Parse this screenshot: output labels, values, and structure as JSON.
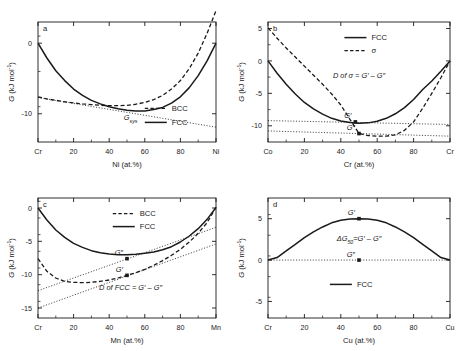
{
  "figure": {
    "background": "#ffffff",
    "ink": "#1a1a1a",
    "panels": [
      "a",
      "b",
      "c",
      "d"
    ]
  },
  "axis_title_y": "G (kJ mol",
  "axis_title_y_sup": "-1",
  "axis_title_y_close": ")",
  "chart_data": [
    {
      "id": "a",
      "type": "line",
      "panel_label": "a",
      "title": "",
      "xlabel": "Ni (at.%)",
      "ylabel": "G (kJ mol-1)",
      "xlim": [
        0,
        100
      ],
      "ylim": [
        -14,
        3
      ],
      "xticks": [
        0,
        20,
        40,
        60,
        80,
        100
      ],
      "xticklabels": [
        "Cr",
        "20",
        "40",
        "60",
        "80",
        "Ni"
      ],
      "yticks": [
        0,
        -10
      ],
      "yticklabels": [
        "0",
        "-10"
      ],
      "grid": false,
      "legend_position": "bottom-right",
      "legend": [
        {
          "name": "BCC",
          "style": "dashed"
        },
        {
          "name": "FCC",
          "style": "solid"
        }
      ],
      "annotations": [
        {
          "text": "G",
          "sub": "sys",
          "x": 52,
          "y": -10.9,
          "italic": true
        }
      ],
      "series": [
        {
          "name": "FCC",
          "style": "solid",
          "x": [
            0,
            5,
            10,
            15,
            20,
            25,
            30,
            35,
            40,
            45,
            50,
            55,
            60,
            65,
            70,
            75,
            80,
            85,
            90,
            95,
            100
          ],
          "y": [
            0.0,
            -2.1,
            -3.9,
            -5.3,
            -6.5,
            -7.4,
            -8.1,
            -8.6,
            -9.0,
            -9.3,
            -9.5,
            -9.6,
            -9.6,
            -9.4,
            -9.1,
            -8.5,
            -7.6,
            -6.3,
            -4.6,
            -2.5,
            0.0
          ]
        },
        {
          "name": "BCC",
          "style": "dashed",
          "x": [
            0,
            5,
            10,
            15,
            20,
            25,
            30,
            35,
            40,
            45,
            50,
            55,
            60,
            65,
            70,
            75,
            80,
            85,
            90,
            95,
            100
          ],
          "y": [
            -7.6,
            -7.9,
            -8.1,
            -8.3,
            -8.45,
            -8.6,
            -8.7,
            -8.8,
            -8.85,
            -8.85,
            -8.8,
            -8.65,
            -8.4,
            -8.0,
            -7.4,
            -6.5,
            -5.3,
            -3.6,
            -1.4,
            1.4,
            4.6
          ]
        },
        {
          "name": "Gsys-tangent",
          "style": "dotted",
          "x": [
            0,
            100
          ],
          "y": [
            -7.7,
            -11.9
          ]
        }
      ]
    },
    {
      "id": "b",
      "type": "line",
      "panel_label": "b",
      "title": "",
      "xlabel": "Cr (at.%)",
      "ylabel": "G (kJ mol-1)",
      "xlim": [
        0,
        100
      ],
      "ylim": [
        -12.5,
        6
      ],
      "xticks": [
        0,
        20,
        40,
        60,
        80,
        100
      ],
      "xticklabels": [
        "Co",
        "20",
        "40",
        "60",
        "80",
        "Cr"
      ],
      "yticks": [
        5,
        0,
        -5,
        -10
      ],
      "yticklabels": [
        "5",
        "0",
        "-5",
        "-10"
      ],
      "grid": false,
      "legend_position": "top-center",
      "legend": [
        {
          "name": "FCC",
          "style": "solid"
        },
        {
          "name": "σ",
          "style": "dashed"
        }
      ],
      "annotations": [
        {
          "text": "D of σ = G′ – G″",
          "x": 50,
          "y": -2.6,
          "italic": true
        }
      ],
      "points": [
        {
          "label": "G′",
          "x": 48,
          "y": -9.4
        },
        {
          "label": "G″",
          "x": 50,
          "y": -11.2
        }
      ],
      "series": [
        {
          "name": "FCC",
          "style": "solid",
          "x": [
            0,
            5,
            10,
            15,
            20,
            25,
            30,
            35,
            40,
            45,
            50,
            55,
            60,
            65,
            70,
            75,
            80,
            85,
            90,
            95,
            100
          ],
          "y": [
            0.0,
            -1.9,
            -3.6,
            -5.1,
            -6.4,
            -7.4,
            -8.2,
            -8.85,
            -9.25,
            -9.5,
            -9.6,
            -9.55,
            -9.3,
            -8.85,
            -8.15,
            -7.2,
            -5.95,
            -4.4,
            -3.1,
            -1.6,
            0.0
          ]
        },
        {
          "name": "σ",
          "style": "dashed",
          "x": [
            0,
            5,
            10,
            15,
            20,
            25,
            30,
            35,
            40,
            45,
            50,
            55,
            60,
            65,
            70,
            75,
            80,
            85,
            90,
            95,
            100
          ],
          "y": [
            5.1,
            3.5,
            2.0,
            0.6,
            -0.8,
            -2.2,
            -3.6,
            -5.1,
            -6.8,
            -9.0,
            -11.2,
            -11.5,
            -11.6,
            -11.6,
            -11.4,
            -10.7,
            -9.4,
            -7.3,
            -5.0,
            -2.6,
            0.0
          ]
        },
        {
          "name": "tangent-upper",
          "style": "dotted",
          "x": [
            0,
            100
          ],
          "y": [
            -9.2,
            -9.8
          ]
        },
        {
          "name": "tangent-lower",
          "style": "dotted",
          "x": [
            0,
            100
          ],
          "y": [
            -10.8,
            -11.6
          ]
        }
      ]
    },
    {
      "id": "c",
      "type": "line",
      "panel_label": "c",
      "title": "",
      "xlabel": "Mn (at.%)",
      "ylabel": "G (kJ mol-1)",
      "xlim": [
        0,
        100
      ],
      "ylim": [
        -16.5,
        1.5
      ],
      "xticks": [
        0,
        20,
        40,
        60,
        80,
        100
      ],
      "xticklabels": [
        "Cr",
        "20",
        "40",
        "60",
        "80",
        "Mn"
      ],
      "yticks": [
        0,
        -5,
        -10,
        -15
      ],
      "yticklabels": [
        "0",
        "-5",
        "-10",
        "-15"
      ],
      "grid": false,
      "legend_position": "top-center",
      "legend": [
        {
          "name": "BCC",
          "style": "dashed"
        },
        {
          "name": "FCC",
          "style": "solid"
        }
      ],
      "annotations": [
        {
          "text": "D of FCC = G′ – G″",
          "x": 52,
          "y": -12.3,
          "italic": true
        }
      ],
      "points": [
        {
          "label": "G″",
          "x": 50,
          "y": -7.6
        },
        {
          "label": "G′",
          "x": 50,
          "y": -10.1
        }
      ],
      "series": [
        {
          "name": "FCC",
          "style": "solid",
          "x": [
            0,
            5,
            10,
            15,
            20,
            25,
            30,
            35,
            40,
            45,
            50,
            55,
            60,
            65,
            70,
            75,
            80,
            85,
            90,
            95,
            100
          ],
          "y": [
            0.0,
            -1.8,
            -3.3,
            -4.4,
            -5.3,
            -5.9,
            -6.4,
            -6.7,
            -6.9,
            -7.0,
            -7.0,
            -6.95,
            -6.8,
            -6.6,
            -6.25,
            -5.8,
            -5.1,
            -4.2,
            -3.1,
            -1.7,
            0.1
          ]
        },
        {
          "name": "BCC",
          "style": "dashed",
          "x": [
            0,
            5,
            10,
            15,
            20,
            25,
            30,
            35,
            40,
            45,
            50,
            55,
            60,
            65,
            70,
            75,
            80,
            85,
            90,
            95,
            100
          ],
          "y": [
            -7.6,
            -9.5,
            -10.5,
            -11.0,
            -11.15,
            -11.2,
            -11.15,
            -11.0,
            -10.8,
            -10.5,
            -10.1,
            -9.7,
            -9.2,
            -8.6,
            -7.9,
            -7.1,
            -6.2,
            -5.1,
            -3.8,
            -2.2,
            0.1
          ]
        },
        {
          "name": "tangent-upper",
          "style": "dotted",
          "x": [
            0,
            100
          ],
          "y": [
            -12.4,
            -2.9
          ]
        },
        {
          "name": "tangent-lower",
          "style": "dotted",
          "x": [
            0,
            100
          ],
          "y": [
            -15.0,
            -5.4
          ]
        }
      ]
    },
    {
      "id": "d",
      "type": "line",
      "panel_label": "d",
      "title": "",
      "xlabel": "Cu (at.%)",
      "ylabel": "G (kJ mol-1)",
      "xlim": [
        0,
        100
      ],
      "ylim": [
        -7,
        7.5
      ],
      "xticks": [
        0,
        20,
        40,
        60,
        80,
        100
      ],
      "xticklabels": [
        "Cr",
        "20",
        "40",
        "60",
        "80",
        "Cu"
      ],
      "yticks": [
        5,
        0,
        -5
      ],
      "yticklabels": [
        "5",
        "0",
        "-5"
      ],
      "grid": false,
      "legend_position": "bottom-center",
      "legend": [
        {
          "name": "FCC",
          "style": "solid"
        }
      ],
      "annotations": [
        {
          "text": "ΔG",
          "sub": "50",
          "tail": "=G′ – G″",
          "x": 50,
          "y": 2.3,
          "italic": true
        }
      ],
      "points": [
        {
          "label": "G′",
          "x": 50,
          "y": 5.0
        },
        {
          "label": "G″",
          "x": 50,
          "y": 0.0
        }
      ],
      "series": [
        {
          "name": "FCC",
          "style": "solid",
          "x": [
            0,
            5,
            10,
            15,
            20,
            25,
            30,
            35,
            40,
            45,
            50,
            55,
            60,
            65,
            70,
            75,
            80,
            85,
            90,
            95,
            100
          ],
          "y": [
            0.0,
            0.3,
            1.1,
            1.9,
            2.7,
            3.4,
            4.0,
            4.5,
            4.8,
            4.95,
            5.0,
            4.95,
            4.8,
            4.5,
            4.0,
            3.4,
            2.7,
            1.9,
            1.1,
            0.3,
            0.0
          ]
        },
        {
          "name": "baseline",
          "style": "dotted",
          "x": [
            0,
            100
          ],
          "y": [
            0.0,
            0.0
          ]
        }
      ]
    }
  ]
}
